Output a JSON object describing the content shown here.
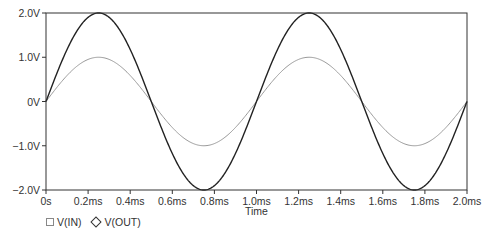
{
  "chart_data": {
    "type": "line",
    "title": "",
    "xlabel": "Time",
    "ylabel": "",
    "x_unit": "ms",
    "xlim": [
      0,
      2.0
    ],
    "ylim": [
      -2.0,
      2.0
    ],
    "grid": false,
    "legend_position": "bottom-left",
    "x_ticks": [
      0,
      0.2,
      0.4,
      0.6,
      0.8,
      1.0,
      1.2,
      1.4,
      1.6,
      1.8,
      2.0
    ],
    "x_tick_labels": [
      "0s",
      "0.2ms",
      "0.4ms",
      "0.6ms",
      "0.8ms",
      "1.0ms",
      "1.2ms",
      "1.4ms",
      "1.6ms",
      "1.8ms",
      "2.0ms"
    ],
    "y_ticks": [
      2.0,
      1.0,
      0,
      -1.0,
      -2.0
    ],
    "y_tick_labels": [
      "2.0V",
      "1.0V",
      "0V",
      "-1.0V",
      "-2.0V"
    ],
    "x": [
      0,
      0.25,
      0.5,
      0.75,
      1.0,
      1.25,
      1.5,
      1.75,
      2.0
    ],
    "series": [
      {
        "name": "V(IN)",
        "marker": "square",
        "color": "#999999",
        "amplitude": 1.0,
        "frequency_khz": 1.0,
        "values": [
          0,
          1.0,
          0,
          -1.0,
          0,
          1.0,
          0,
          -1.0,
          0
        ]
      },
      {
        "name": "V(OUT)",
        "marker": "diamond",
        "color": "#222222",
        "amplitude": 2.0,
        "frequency_khz": 1.0,
        "values": [
          0,
          2.0,
          0,
          -2.0,
          0,
          2.0,
          0,
          -2.0,
          0
        ]
      }
    ]
  },
  "legend": {
    "items": [
      {
        "label": "V(IN)",
        "symbol": "square-icon"
      },
      {
        "label": "V(OUT)",
        "symbol": "diamond-icon"
      }
    ]
  },
  "axes": {
    "x_title": "Time"
  }
}
